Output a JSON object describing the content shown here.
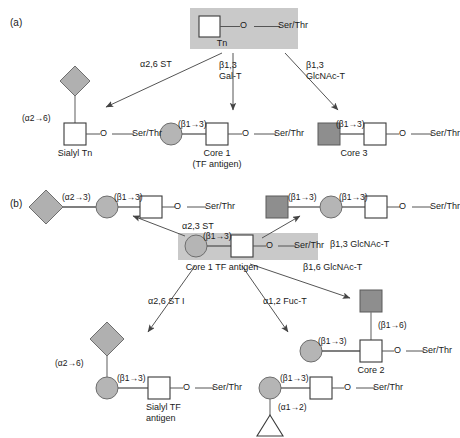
{
  "figure": {
    "type": "pathway-diagram",
    "panels": [
      "a",
      "b"
    ],
    "colors": {
      "highlight_band": "#c9c9c9",
      "galnac_square_fill": "#ffffff",
      "galnac_square_stroke": "#3a3a3a",
      "gal_circle_fill": "#b5b5b5",
      "glcnac_square_fill": "#8e8e8e",
      "sialic_diamond_fill": "#b0b0b0",
      "fucose_triangle_fill": "#ffffff",
      "line": "#555555",
      "text": "#1a1a1a"
    }
  },
  "panel_a": {
    "letter": "(a)",
    "start": {
      "name": "Tn",
      "highlighted": true,
      "residues": [
        "GalNAc-square",
        "O",
        "Ser/Thr"
      ],
      "o_label": "O",
      "serthr_label": "Ser/Thr"
    },
    "enzymes": [
      {
        "id": "a26st",
        "label": "α2,6 ST",
        "to": "Sialyl Tn"
      },
      {
        "id": "b13galt",
        "label_line1": "β1,3",
        "label_line2": "Gal-T",
        "to": "Core 1"
      },
      {
        "id": "b13glcnact",
        "label_line1": "β1,3",
        "label_line2": "GlcNAc-T",
        "to": "Core 3"
      }
    ],
    "products": [
      {
        "id": "sialyl-tn",
        "name": "Sialyl Tn",
        "name_lines": [
          "Sialyl Tn"
        ],
        "linkages": [
          "(α2→6)"
        ],
        "o_label": "O",
        "serthr_label": "Ser/Thr"
      },
      {
        "id": "core-1",
        "name": "Core 1",
        "name_lines": [
          "Core 1",
          "(TF antigen)"
        ],
        "linkages": [
          "(β1→3)"
        ],
        "o_label": "O",
        "serthr_label": "Ser/Thr"
      },
      {
        "id": "core-3",
        "name": "Core 3",
        "name_lines": [
          "Core 3"
        ],
        "linkages": [
          "(β1→3)"
        ],
        "o_label": "O",
        "serthr_label": "Ser/Thr"
      }
    ]
  },
  "panel_b": {
    "letter": "(b)",
    "center": {
      "name": "Core 1 TF antigen",
      "highlighted": true,
      "linkages": [
        "(β1→3)"
      ],
      "o_label": "O",
      "serthr_label": "Ser/Thr"
    },
    "enzymes": [
      {
        "id": "a23st",
        "label": "α2,3 ST"
      },
      {
        "id": "b13glcnact-b",
        "label": "β1,3 GlcNAc-T"
      },
      {
        "id": "b16glcnact",
        "label": "β1,6 GlcNAc-T"
      },
      {
        "id": "a26sti",
        "label": "α2,6 ST I"
      },
      {
        "id": "a12fuct",
        "label": "α1,2 Fuc-T"
      }
    ],
    "products": [
      {
        "id": "sialyl-core1-23",
        "linkages": [
          "(α2→3)",
          "(β1→3)"
        ],
        "o_label": "O",
        "serthr_label": "Ser/Thr",
        "name_lines": []
      },
      {
        "id": "extended-core1",
        "linkages": [
          "(β1→3)",
          "(β1→3)"
        ],
        "o_label": "O",
        "serthr_label": "Ser/Thr",
        "name_lines": []
      },
      {
        "id": "sialyl-tf-antigen",
        "name": "Sialyl TF antigen",
        "name_lines": [
          "Sialyl TF",
          "antigen"
        ],
        "linkages": [
          "(α2→6)",
          "(β1→3)"
        ],
        "o_label": "O",
        "serthr_label": "Ser/Thr"
      },
      {
        "id": "core-2",
        "name": "Core 2",
        "name_lines": [
          "Core 2"
        ],
        "linkages": [
          "(β1→6)",
          "(β1→3)"
        ],
        "o_label": "O",
        "serthr_label": "Ser/Thr"
      },
      {
        "id": "fucosylated-core1",
        "name_lines": [],
        "linkages": [
          "(β1→3)",
          "(α1→2)"
        ],
        "o_label": "O",
        "serthr_label": "Ser/Thr"
      }
    ]
  }
}
